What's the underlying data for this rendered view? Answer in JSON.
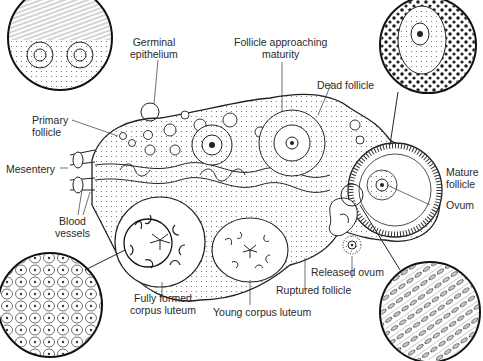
{
  "diagram": {
    "labels": {
      "germinal_epithelium": [
        "Germinal",
        "epithelium"
      ],
      "follicle_approaching_maturity": [
        "Follicle approaching",
        "maturity"
      ],
      "dead_follicle": "Dead follicle",
      "primary_follicle": [
        "Primary",
        "follicle"
      ],
      "mesentery": "Mesentery",
      "blood_vessels": [
        "Blood",
        "vessels"
      ],
      "mature_follicle": [
        "Mature",
        "follicle"
      ],
      "ovum": "Ovum",
      "released_ovum": "Released ovum",
      "ruptured_follicle": "Ruptured follicle",
      "fully_formed_corpus_luteum": [
        "Fully formed",
        "corpus luteum"
      ],
      "young_corpus_luteum": "Young corpus luteum"
    },
    "colors": {
      "ink": "#222222",
      "background": "#ffffff",
      "stipple": "#555555"
    }
  }
}
